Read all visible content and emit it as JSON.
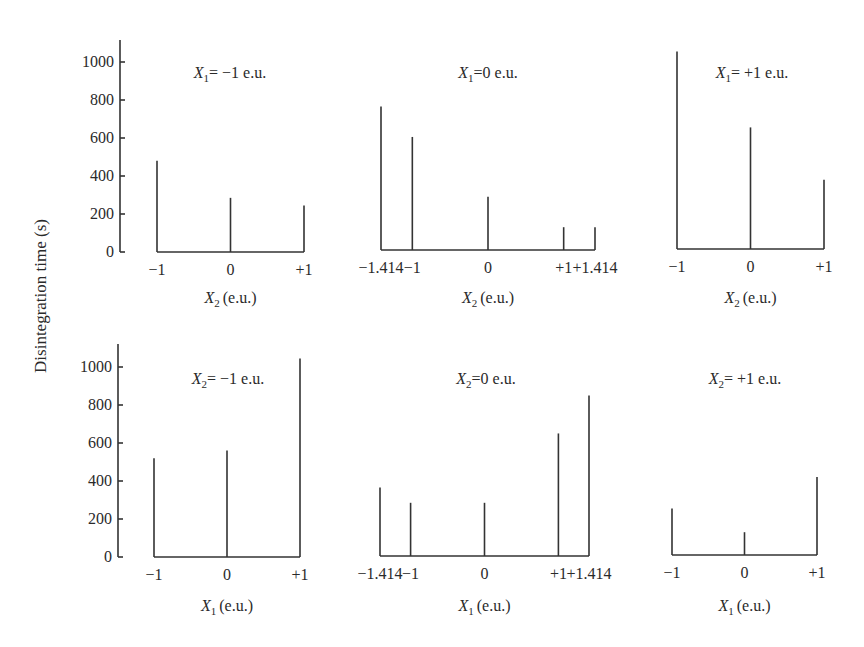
{
  "ylabel": "Disintegration time (s)",
  "y_ticks": [
    0,
    200,
    400,
    600,
    800,
    1000
  ],
  "chart_data": [
    {
      "type": "bar",
      "title": "X1 = -1 e.u.",
      "title_var": "X",
      "title_sub": "1",
      "title_rest": "= -1 e.u.",
      "xlabel": "X2 (e.u.)",
      "xlabel_var": "X",
      "xlabel_sub": "2",
      "xlabel_rest": "(e.u.)",
      "ylabel": "Disintegration time (s)",
      "ylim": [
        0,
        1100
      ],
      "categories": [
        "-1",
        "0",
        "+1"
      ],
      "x": [
        -1,
        0,
        1
      ],
      "values": [
        480,
        285,
        245
      ]
    },
    {
      "type": "bar",
      "title": "X1 = 0 e.u.",
      "title_var": "X",
      "title_sub": "1",
      "title_rest": "=0 e.u.",
      "xlabel": "X2 (e.u.)",
      "xlabel_var": "X",
      "xlabel_sub": "2",
      "xlabel_rest": "(e.u.)",
      "ylabel": "Disintegration time (s)",
      "ylim": [
        0,
        1100
      ],
      "categories": [
        "-1.414",
        "-1",
        "0",
        "+1",
        "+1.414"
      ],
      "x": [
        -1.414,
        -1,
        0,
        1,
        1.414
      ],
      "values": [
        755,
        595,
        280,
        120,
        120
      ]
    },
    {
      "type": "bar",
      "title": "X1 = +1 e.u.",
      "title_var": "X",
      "title_sub": "1",
      "title_rest": "= +1 e.u.",
      "xlabel": "X2 (e.u.)",
      "xlabel_var": "X",
      "xlabel_sub": "2",
      "xlabel_rest": "(e.u.)",
      "ylabel": "Disintegration time (s)",
      "ylim": [
        0,
        1100
      ],
      "categories": [
        "-1",
        "0",
        "+1"
      ],
      "x": [
        -1,
        0,
        1
      ],
      "values": [
        1040,
        640,
        365
      ]
    },
    {
      "type": "bar",
      "title": "X2 = -1 e.u.",
      "title_var": "X",
      "title_sub": "2",
      "title_rest": "= -1 e.u.",
      "xlabel": "X1 (e.u.)",
      "xlabel_var": "X",
      "xlabel_sub": "1",
      "xlabel_rest": "(e.u.)",
      "ylabel": "Disintegration time (s)",
      "ylim": [
        0,
        1100
      ],
      "categories": [
        "-1",
        "0",
        "+1"
      ],
      "x": [
        -1,
        0,
        1
      ],
      "values": [
        520,
        560,
        1045
      ]
    },
    {
      "type": "bar",
      "title": "X2 = 0 e.u.",
      "title_var": "X",
      "title_sub": "2",
      "title_rest": "=0 e.u.",
      "xlabel": "X1 (e.u.)",
      "xlabel_var": "X",
      "xlabel_sub": "1",
      "xlabel_rest": "(e.u.)",
      "ylabel": "Disintegration time (s)",
      "ylim": [
        0,
        1100
      ],
      "categories": [
        "-1.414",
        "-1",
        "0",
        "+1",
        "+1.414"
      ],
      "x": [
        -1.414,
        -1,
        0,
        1,
        1.414
      ],
      "values": [
        360,
        280,
        280,
        645,
        845
      ]
    },
    {
      "type": "bar",
      "title": "X2 = +1 e.u.",
      "title_var": "X",
      "title_sub": "2",
      "title_rest": "= +1 e.u.",
      "xlabel": "X1 (e.u.)",
      "xlabel_var": "X",
      "xlabel_sub": "1",
      "xlabel_rest": "(e.u.)",
      "ylabel": "Disintegration time (s)",
      "ylim": [
        0,
        1100
      ],
      "categories": [
        "-1",
        "0",
        "+1"
      ],
      "x": [
        -1,
        0,
        1
      ],
      "values": [
        245,
        120,
        410
      ]
    }
  ]
}
